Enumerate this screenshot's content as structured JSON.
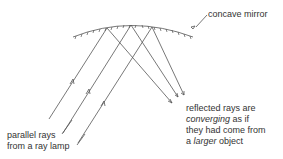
{
  "labels": {
    "mirror": "concave mirror",
    "incident_line1": "parallel rays",
    "incident_line2": "from a ray lamp",
    "reflected_line1": "reflected rays are",
    "reflected_line2_em": "converging",
    "reflected_line2_rest": " as if",
    "reflected_line3": "they had come from",
    "reflected_line4_pre": "a ",
    "reflected_line4_em": "larger",
    "reflected_line4_rest": " object"
  },
  "colors": {
    "line": "#555555",
    "text": "#333333"
  }
}
